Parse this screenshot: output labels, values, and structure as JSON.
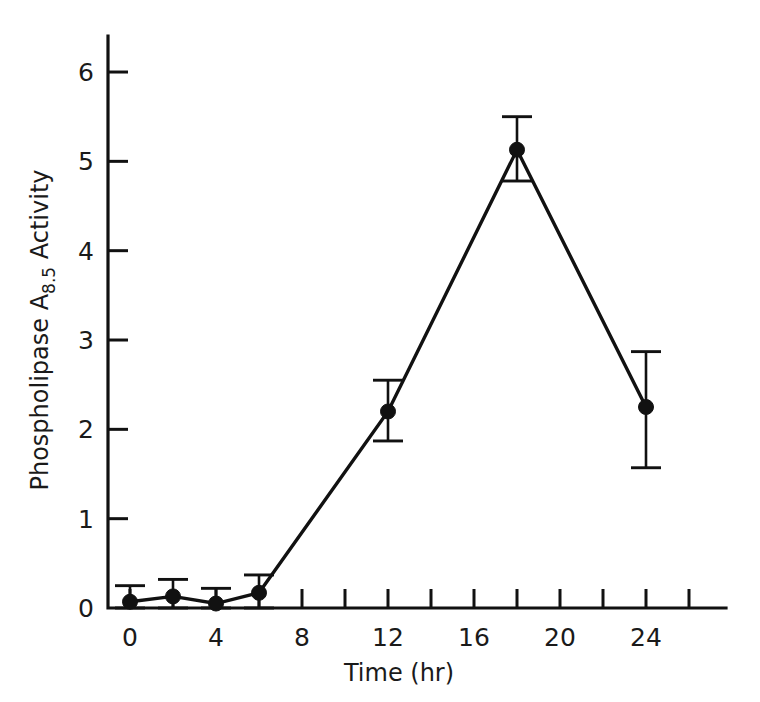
{
  "figure": {
    "background_color": "#ffffff",
    "ink_color": "#111111",
    "caption": ""
  },
  "chart_data": {
    "type": "line",
    "title": "",
    "subtitle": "",
    "xlabel": "Time (hr)",
    "ylabel_prefix": "Phospholipase A",
    "ylabel_subscript": "8.5",
    "ylabel_suffix": " Activity",
    "ylabel_full": "Phospholipase A8.5 Activity",
    "x": [
      0,
      2,
      4,
      6,
      12,
      18,
      24
    ],
    "values": [
      0.07,
      0.13,
      0.05,
      0.17,
      2.2,
      5.13,
      2.25
    ],
    "error_low": [
      0.07,
      0.13,
      0.05,
      0.17,
      0.33,
      0.35,
      0.68
    ],
    "error_high": [
      0.18,
      0.19,
      0.17,
      0.2,
      0.35,
      0.37,
      0.62
    ],
    "points": [
      {
        "x": 0,
        "y": 0.07,
        "err_low": 0.07,
        "err_high": 0.18
      },
      {
        "x": 2,
        "y": 0.13,
        "err_low": 0.13,
        "err_high": 0.19
      },
      {
        "x": 4,
        "y": 0.05,
        "err_low": 0.05,
        "err_high": 0.17
      },
      {
        "x": 6,
        "y": 0.17,
        "err_low": 0.17,
        "err_high": 0.2
      },
      {
        "x": 12,
        "y": 2.2,
        "err_low": 0.33,
        "err_high": 0.35
      },
      {
        "x": 18,
        "y": 5.13,
        "err_low": 0.35,
        "err_high": 0.37
      },
      {
        "x": 24,
        "y": 2.25,
        "err_low": 0.68,
        "err_high": 0.62
      }
    ],
    "series": [
      {
        "name": "Phospholipase A8.5 Activity",
        "values": [
          0.07,
          0.13,
          0.05,
          0.17,
          2.2,
          5.13,
          2.25
        ]
      }
    ],
    "xlim": [
      -1.05,
      28.6
    ],
    "ylim": [
      0,
      6.45
    ],
    "xticks": [
      0,
      2,
      4,
      6,
      8,
      10,
      12,
      14,
      16,
      18,
      20,
      22,
      24,
      26
    ],
    "xtick_labels_shown": [
      "0",
      "",
      "4",
      "",
      "8",
      "",
      "12",
      "",
      "16",
      "",
      "20",
      "",
      "24",
      ""
    ],
    "xtick_labels": [
      "0",
      "4",
      "8",
      "12",
      "16",
      "20",
      "24"
    ],
    "xtick_label_values": [
      0,
      4,
      8,
      12,
      16,
      20,
      24
    ],
    "yticks": [
      0,
      1,
      2,
      3,
      4,
      5,
      6
    ],
    "ytick_labels": [
      "0",
      "1",
      "2",
      "3",
      "4",
      "5",
      "6"
    ],
    "grid": false,
    "legend": false,
    "legend_position": "none",
    "marker": "filled-circle",
    "error_bars": true,
    "line_color": "#111111",
    "marker_color": "#111111"
  }
}
